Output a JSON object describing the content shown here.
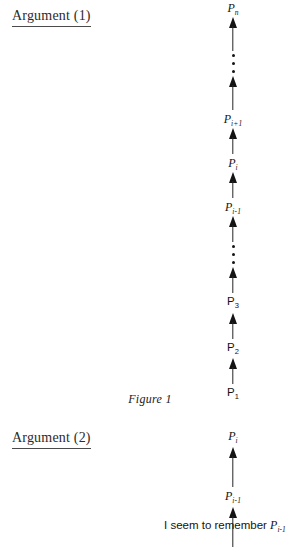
{
  "page": {
    "background_color": "#ffffff",
    "ink_color": "#141414"
  },
  "sections": {
    "argument_1": {
      "heading": "Argument (1)"
    },
    "argument_2": {
      "heading": "Argument (2)"
    }
  },
  "figure_caption": "Figure 1",
  "chart_data": {
    "type": "diagram",
    "title": "Figure 1",
    "diagrams": [
      {
        "name": "argument-1-chain",
        "heading": "Argument (1)",
        "caption": "Figure 1",
        "direction": "bottom-to-top",
        "nodes_top_to_bottom": [
          "P_n",
          "⋮",
          "P_i+1",
          "P_i",
          "P_i-1",
          "⋮",
          "P_3",
          "P_2",
          "P_1"
        ],
        "arrow_count": 8,
        "ellipsis_count": 2
      },
      {
        "name": "argument-2-chain",
        "heading": "Argument (2)",
        "direction": "bottom-to-top",
        "nodes_top_to_bottom": [
          "P_i",
          "P_i-1",
          "I seem to remember P_i-1"
        ],
        "arrow_count": 2,
        "ellipsis_count": 0
      }
    ]
  },
  "chain_1": {
    "nodes": {
      "p_n": {
        "base": "P",
        "sub": "n",
        "style": "italic"
      },
      "p_ip1": {
        "base": "P",
        "sub": "i+1",
        "style": "italic"
      },
      "p_i": {
        "base": "P",
        "sub": "i",
        "style": "italic"
      },
      "p_im1": {
        "base": "P",
        "sub": "i-1",
        "style": "italic"
      },
      "p_3": {
        "base": "P",
        "sub": "3",
        "style": "upright"
      },
      "p_2": {
        "base": "P",
        "sub": "2",
        "style": "upright"
      },
      "p_1": {
        "base": "P",
        "sub": "1",
        "style": "upright"
      }
    }
  },
  "chain_2": {
    "nodes": {
      "p_i": {
        "base": "P",
        "sub": "i",
        "style": "italic"
      },
      "p_im1": {
        "base": "P",
        "sub": "i-1",
        "style": "italic"
      }
    },
    "premise": {
      "text": "I seem to remember ",
      "symbol_base": "P",
      "symbol_sub": "i-1"
    }
  }
}
